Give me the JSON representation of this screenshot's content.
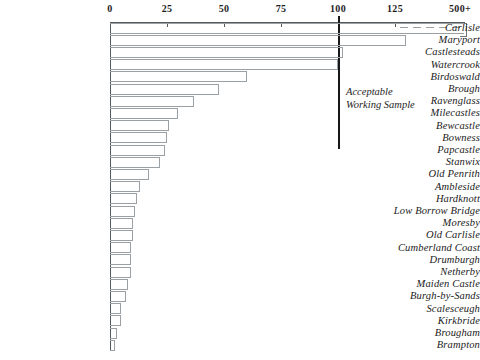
{
  "chart_data": {
    "type": "bar",
    "orientation": "horizontal",
    "title": "",
    "xlabel": "",
    "ylabel": "",
    "xlim": [
      0,
      135
    ],
    "grid": false,
    "legend": null,
    "axis": {
      "tick_values": [
        0,
        25,
        50,
        75,
        100,
        125
      ],
      "tick_labels": [
        "0",
        "25",
        "50",
        "75",
        "100",
        "125"
      ],
      "overflow_tick_label": "500+",
      "position": "top"
    },
    "annotations": [
      {
        "name": "acceptable-working-sample",
        "text_line1": "Acceptable",
        "text_line2": "Working  Sample",
        "at_value": 100
      }
    ],
    "categories": [
      "Carlisle",
      "Maryport",
      "Castlesteads",
      "Watercrook",
      "Birdoswald",
      "Brough",
      "Ravenglass",
      "Milecastles",
      "Bewcastle",
      "Bowness",
      "Papcastle",
      "Stanwix",
      "Old  Penrith",
      "Ambleside",
      "Hardknott",
      "Low Borrow  Bridge",
      "Moresby",
      "Old  Carlisle",
      "Cumberland  Coast",
      "Drumburgh",
      "Netherby",
      "Maiden  Castle",
      "Burgh-by-Sands",
      "Scalesceugh",
      "Kirkbride",
      "Brougham",
      "Brampton"
    ],
    "values": [
      500,
      130,
      102,
      100,
      60,
      48,
      37,
      30,
      26,
      25,
      24,
      22,
      17,
      13,
      12,
      11,
      10,
      10,
      9,
      9,
      9,
      8,
      7,
      5,
      5,
      3,
      2
    ],
    "value_is_truncated": [
      true,
      false,
      false,
      false,
      false,
      false,
      false,
      false,
      false,
      false,
      false,
      false,
      false,
      false,
      false,
      false,
      false,
      false,
      false,
      false,
      false,
      false,
      false,
      false,
      false,
      false,
      false
    ]
  },
  "colors": {
    "bar_stroke": "#9aa0a4",
    "axis": "#555a5e",
    "threshold": "#16181a",
    "text": "#1a1a1a",
    "background": "#ffffff"
  }
}
